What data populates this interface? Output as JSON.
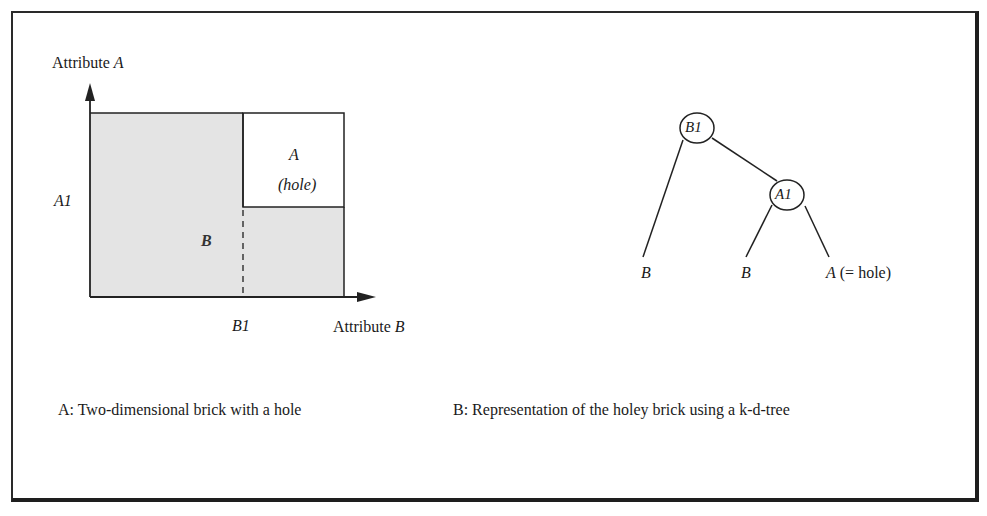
{
  "panel_a": {
    "y_axis_label_prefix": "Attribute ",
    "y_axis_label_var": "A",
    "x_axis_label_prefix": "Attribute ",
    "x_axis_label_var": "B",
    "y_tick": "A1",
    "x_tick": "B1",
    "region_b_label": "B",
    "hole_label": "A",
    "hole_sublabel": "(hole)",
    "caption": "A: Two-dimensional brick with a hole",
    "colors": {
      "brick_fill": "#e4e4e4",
      "hole_fill": "#ffffff",
      "line": "#222222"
    }
  },
  "panel_b": {
    "root_node": "B1",
    "inner_node": "A1",
    "leaves": [
      "B",
      "B",
      "A"
    ],
    "leaf_hole_suffix": " (= hole)",
    "caption": "B: Representation of the holey brick using a k-d-tree"
  }
}
